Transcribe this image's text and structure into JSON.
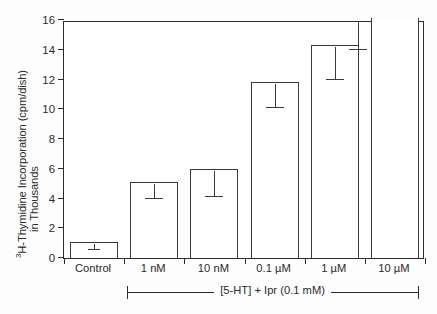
{
  "chart_data": {
    "type": "bar",
    "title": "",
    "xlabel": "[5-HT] + Ipr (0.1 mM)",
    "ylabel": "3H-Thymidine Incorporation (cpm/dish) in Thousands",
    "ylabel_line1_prefix": "3",
    "ylabel_line1": "H-Thymidine Incorporation (cpm/dish)",
    "ylabel_line2": "in Thousands",
    "categories": [
      "Control",
      "1 nM",
      "10 nM",
      "0.1 µM",
      "1 µM",
      "10 µM"
    ],
    "values": [
      1.1,
      5.1,
      6.0,
      11.8,
      14.3,
      16.0
    ],
    "clipped": [
      false,
      false,
      false,
      false,
      false,
      true
    ],
    "err_low": [
      0.75,
      4.2,
      4.3,
      10.3,
      12.2,
      14.2
    ],
    "err_high": [
      1.1,
      5.1,
      6.0,
      11.8,
      14.3,
      16.0
    ],
    "ylim": [
      0,
      16
    ],
    "yticks": [
      0,
      2,
      4,
      6,
      8,
      10,
      12,
      14,
      16
    ],
    "ytick_labels": [
      "0",
      "2",
      "4",
      "6",
      "8",
      "10",
      "12",
      "14",
      "16"
    ],
    "grid": false,
    "legend": "none",
    "bar_fill": "#ffffff",
    "bar_edge": "#3a3a3a",
    "axis_color": "#2b2b2b"
  },
  "bracket": {
    "label": "[5-HT] + Ipr (0.1 mM)"
  }
}
